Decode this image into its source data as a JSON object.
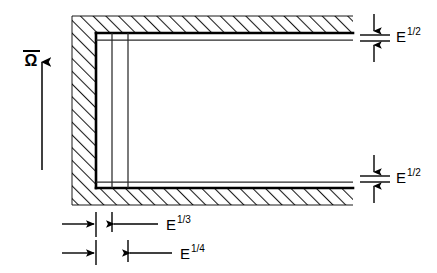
{
  "figure": {
    "rotation": {
      "symbol": "Ω",
      "overbar": true,
      "arrow_direction": "up",
      "name": "rotation-vector-omega"
    },
    "labels": {
      "top_right": {
        "base": "E",
        "sup": "1/2",
        "text": "E1/2"
      },
      "bottom_right": {
        "base": "E",
        "sup": "1/2",
        "text": "E1/2"
      },
      "bottom_first": {
        "base": "E",
        "sup": "1/3",
        "text": "E1/3"
      },
      "bottom_second": {
        "base": "E",
        "sup": "1/4",
        "text": "E1/4"
      }
    },
    "colors": {
      "ink": "#000000",
      "background": "#ffffff",
      "hatch": "#1a1a1a",
      "thin_line": "#2b2b2b"
    },
    "geometry": {
      "wall_left_x": 72,
      "wall_inner_x": 96,
      "wall_top_y": 16,
      "wall_inner_top_y": 33,
      "wall_bottom_y": 205,
      "wall_inner_bottom_y": 188,
      "domain_right_x": 352,
      "layer_line_1_x": 112,
      "layer_line_2_x": 128,
      "ekman_top_y": 40,
      "ekman_bottom_y": 182
    },
    "annotations": {
      "ekman_layer_label": "E1/2",
      "stewartson_e13_label": "E1/3",
      "stewartson_e14_label": "E1/4"
    }
  }
}
